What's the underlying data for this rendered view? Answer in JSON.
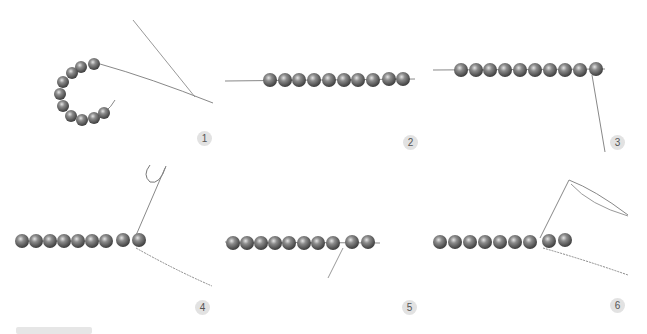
{
  "figure": {
    "colors": {
      "background": "#ffffff",
      "bead": "#6f6f6f",
      "bead_highlight": "#d8d8d8",
      "thread": "#8a8a8a",
      "badge_bg": "#e2e2e2",
      "badge_text": "#555555"
    },
    "steps": [
      {
        "number": "1",
        "caption": ""
      },
      {
        "number": "2",
        "caption": ""
      },
      {
        "number": "3",
        "caption": ""
      },
      {
        "number": "4",
        "caption": ""
      },
      {
        "number": "5",
        "caption": ""
      },
      {
        "number": "6",
        "caption": ""
      }
    ]
  }
}
